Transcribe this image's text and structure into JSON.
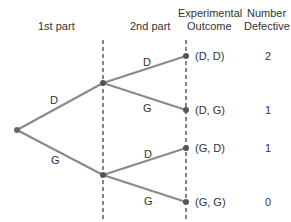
{
  "headers": {
    "first_part": "1st part",
    "second_part": "2nd part",
    "experimental": "Experimental",
    "outcome": "Outcome",
    "number": "Number",
    "defective": "Defective"
  },
  "first_stage": {
    "upper_label": "D",
    "lower_label": "G"
  },
  "second_stage": {
    "upper_d": "D",
    "upper_g": "G",
    "lower_d": "D",
    "lower_g": "G"
  },
  "outcomes": [
    {
      "label": "(D, D)",
      "defective": "2"
    },
    {
      "label": "(D, G)",
      "defective": "1"
    },
    {
      "label": "(G, D)",
      "defective": "1"
    },
    {
      "label": "(G, G)",
      "defective": "0"
    }
  ],
  "colors": {
    "branch": "#8a8a8a",
    "node": "#555555",
    "dashed": "#333333",
    "text": "#333333"
  }
}
